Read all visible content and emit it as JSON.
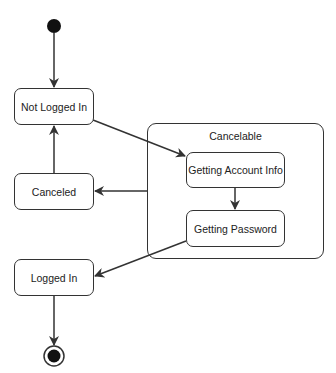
{
  "diagram": {
    "type": "UML state machine",
    "states": {
      "not_logged_in": "Not Logged In",
      "canceled": "Canceled",
      "logged_in": "Logged In",
      "getting_account_info": "Getting Account Info",
      "getting_password": "Getting Password"
    },
    "composite": {
      "label": "Cancelable"
    },
    "transitions": [
      {
        "from": "initial",
        "to": "Not Logged In"
      },
      {
        "from": "Not Logged In",
        "to": "Getting Account Info"
      },
      {
        "from": "Getting Account Info",
        "to": "Getting Password"
      },
      {
        "from": "Cancelable",
        "to": "Canceled"
      },
      {
        "from": "Canceled",
        "to": "Not Logged In"
      },
      {
        "from": "Getting Password",
        "to": "Logged In"
      },
      {
        "from": "Logged In",
        "to": "final"
      }
    ],
    "colors": {
      "stroke": "#333333",
      "fill": "#ffffff",
      "text": "#222222"
    }
  }
}
